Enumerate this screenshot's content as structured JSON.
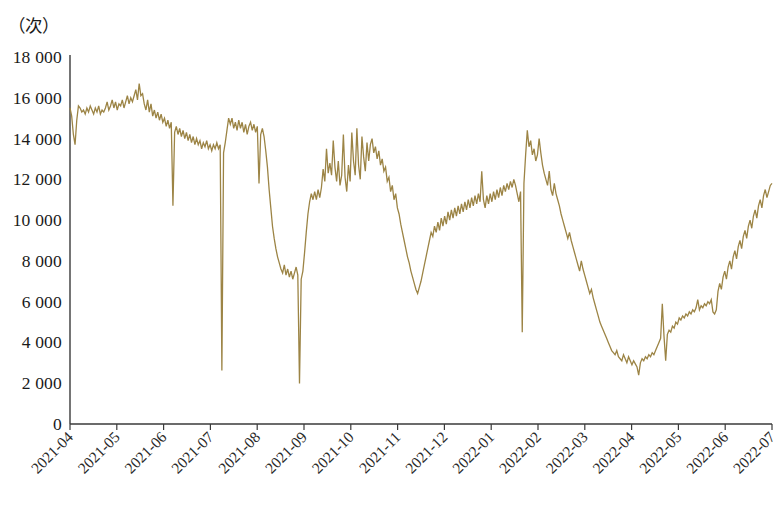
{
  "chart_data": {
    "type": "line",
    "title": "",
    "subtitle": "",
    "xlabel": "",
    "ylabel": "（次）",
    "ylabel_note": "unit label shown at top-left of plot, meaning 'times / occurrences'",
    "grid": false,
    "legend": null,
    "legend_position": "none",
    "line_color": "#9C8445",
    "line_width": 1.3,
    "axis_color": "#3a3a3a",
    "background": "#ffffff",
    "ylim": [
      0,
      18000
    ],
    "y_ticks": [
      0,
      2000,
      4000,
      6000,
      8000,
      10000,
      12000,
      14000,
      16000,
      18000
    ],
    "y_tick_labels": [
      "0",
      "2 000",
      "4 000",
      "6 000",
      "8 000",
      "10 000",
      "12 000",
      "14 000",
      "16 000",
      "18 000"
    ],
    "x_tick_labels": [
      "2021-04",
      "2021-05",
      "2021-06",
      "2021-07",
      "2021-08",
      "2021-09",
      "2021-10",
      "2021-11",
      "2021-12",
      "2022-01",
      "2022-02",
      "2022-03",
      "2022-04",
      "2022-05",
      "2022-06",
      "2022-07"
    ],
    "x_tick_rotation_deg": 45,
    "x_range_start": "2021-04",
    "x_range_end": "2022-07",
    "annotations": [],
    "series": [
      {
        "name": "daily_count",
        "color": "#9C8445",
        "x_start_index": 0,
        "x_points_per_month": 30,
        "values": [
          15500,
          15100,
          14200,
          13700,
          14900,
          15600,
          15500,
          15300,
          15400,
          15200,
          15500,
          15300,
          15600,
          15400,
          15200,
          15500,
          15300,
          15600,
          15200,
          15400,
          15300,
          15500,
          15800,
          15400,
          15600,
          15900,
          15500,
          15800,
          15400,
          15700,
          15600,
          15900,
          15500,
          15800,
          16100,
          15700,
          16000,
          15800,
          16100,
          16400,
          15900,
          16700,
          16100,
          16200,
          15700,
          15400,
          15900,
          15300,
          15700,
          15100,
          15400,
          15000,
          15300,
          14900,
          15200,
          14800,
          15000,
          14600,
          14900,
          14500,
          14800,
          10700,
          14300,
          14600,
          14200,
          14500,
          14100,
          14400,
          14000,
          14300,
          13900,
          14200,
          13800,
          14100,
          13700,
          14000,
          13700,
          13900,
          13500,
          13800,
          13600,
          13900,
          13500,
          13700,
          13400,
          13700,
          13500,
          13800,
          13500,
          13700,
          2620,
          13300,
          13800,
          14400,
          15000,
          14700,
          15000,
          14500,
          14800,
          14400,
          14900,
          14500,
          14800,
          14300,
          14700,
          14200,
          14600,
          14800,
          14400,
          14700,
          14300,
          14600,
          11800,
          14200,
          14500,
          14100,
          13400,
          12600,
          11500,
          10600,
          9700,
          9100,
          8600,
          8200,
          7900,
          7600,
          7400,
          7800,
          7300,
          7600,
          7200,
          7500,
          7100,
          7400,
          7700,
          7300,
          1990,
          7100,
          7500,
          8400,
          9400,
          10300,
          10900,
          11300,
          11000,
          11400,
          11000,
          11500,
          11100,
          11600,
          12500,
          11900,
          13500,
          12300,
          12800,
          12200,
          13900,
          12600,
          11900,
          12900,
          11700,
          12200,
          14200,
          12100,
          11400,
          12700,
          11900,
          14300,
          12900,
          12200,
          14500,
          12700,
          12000,
          14100,
          13100,
          12400,
          13800,
          12900,
          13700,
          14000,
          13300,
          13600,
          13000,
          13400,
          12700,
          13000,
          12400,
          12600,
          11900,
          12100,
          11400,
          11700,
          11000,
          11300,
          10600,
          10300,
          9800,
          9400,
          9000,
          8600,
          8200,
          7900,
          7500,
          7200,
          6900,
          6600,
          6400,
          6700,
          7000,
          7400,
          7800,
          8200,
          8600,
          9000,
          9400,
          9200,
          9700,
          9400,
          9900,
          9500,
          10100,
          9700,
          10200,
          9800,
          10400,
          10000,
          10500,
          10100,
          10600,
          10200,
          10700,
          10300,
          10800,
          10400,
          10900,
          10500,
          11000,
          10600,
          11100,
          10700,
          11200,
          10800,
          11300,
          10900,
          12400,
          11000,
          10600,
          11200,
          10800,
          11300,
          10900,
          11400,
          11000,
          11500,
          11100,
          11600,
          11200,
          11700,
          11400,
          11800,
          11500,
          11900,
          11600,
          12000,
          11700,
          11300,
          10900,
          11400,
          4500,
          11800,
          13200,
          14400,
          13600,
          13900,
          13200,
          13500,
          12900,
          13200,
          14000,
          13300,
          12700,
          12300,
          12000,
          11700,
          12400,
          11500,
          11200,
          11800,
          11300,
          11000,
          10700,
          10300,
          10000,
          9700,
          9400,
          9100,
          9400,
          9000,
          8700,
          8400,
          8100,
          7800,
          7500,
          8000,
          7600,
          7300,
          7000,
          6700,
          6400,
          6600,
          6200,
          5900,
          5600,
          5300,
          5000,
          4800,
          4600,
          4400,
          4200,
          4000,
          3800,
          3600,
          3500,
          3400,
          3600,
          3300,
          3200,
          3100,
          3400,
          3200,
          3000,
          3300,
          3100,
          2900,
          3100,
          2950,
          2800,
          2400,
          3000,
          3200,
          3100,
          3300,
          3200,
          3400,
          3300,
          3500,
          3400,
          3600,
          3800,
          4000,
          4200,
          5900,
          4300,
          3100,
          4400,
          4600,
          4500,
          4800,
          4700,
          5000,
          4900,
          5200,
          5100,
          5300,
          5200,
          5400,
          5300,
          5500,
          5400,
          5600,
          5500,
          5700,
          6100,
          5600,
          5800,
          5700,
          5900,
          5800,
          6000,
          5900,
          6100,
          5500,
          5400,
          5600,
          6500,
          6900,
          6600,
          7200,
          7500,
          7100,
          7700,
          8000,
          7600,
          8200,
          8500,
          8100,
          8700,
          9000,
          8600,
          9200,
          9500,
          9100,
          9700,
          10000,
          9600,
          10200,
          10500,
          10100,
          10700,
          11000,
          10600,
          11200,
          11500,
          11100,
          11400,
          11700,
          11800
        ]
      }
    ]
  },
  "plot_geometry": {
    "left": 70,
    "right": 772,
    "top": 57,
    "bottom": 424
  }
}
